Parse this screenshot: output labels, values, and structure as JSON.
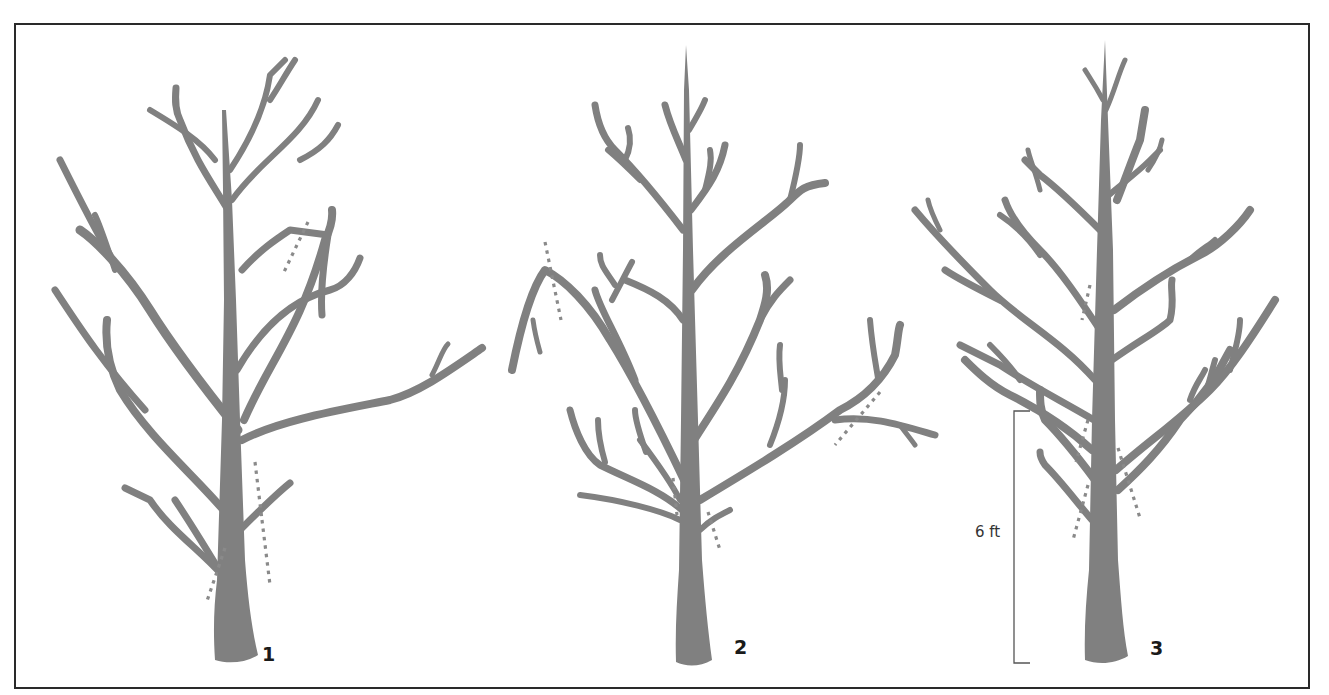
{
  "diagram": {
    "type": "tree-pruning-sequence",
    "frame": {
      "border_color": "#2a2a2a",
      "background": "#ffffff"
    },
    "colors": {
      "branch": "#808080",
      "cut_line": "#8a8a8a",
      "label": "#1a1a1a"
    },
    "trees": [
      {
        "id": 1,
        "label": "1",
        "description": "Young tree before pruning with crossing/rubbing branches and competing leaders; dotted lines mark cuts"
      },
      {
        "id": 2,
        "label": "2",
        "description": "Tree after first round of pruning; dotted lines mark broken branch and low limbs to remove"
      },
      {
        "id": 3,
        "label": "3",
        "description": "Tree with single central leader; low limbs marked for removal up to 6 ft"
      }
    ],
    "measurement": {
      "label": "6 ft",
      "meaning": "Height of lower trunk cleared of branches"
    }
  }
}
